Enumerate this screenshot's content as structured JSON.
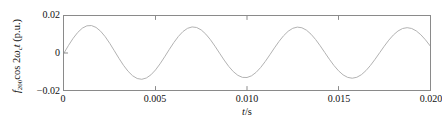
{
  "chart_data": {
    "type": "line",
    "title": "",
    "subtitle": "",
    "ylabel_prefix": "f",
    "ylabel_subscript": "200",
    "ylabel_mid": "cos 2",
    "ylabel_omega": "ω",
    "ylabel_omega_sub": "c",
    "ylabel_t": "t",
    "ylabel_units": " (p.u.)",
    "xlabel_var": "t",
    "xlabel_unit": "/s",
    "xlabel": "t/s",
    "ylabel": "f200cos 2ωct (p.u.)",
    "xlim": [
      0,
      0.02
    ],
    "ylim": [
      -0.02,
      0.02
    ],
    "xticks": [
      0,
      0.005,
      0.01,
      0.015,
      0.02
    ],
    "xticklabels": [
      "0",
      "0.005",
      "0.010",
      "0.015",
      "0.020"
    ],
    "yticks": [
      0.02,
      0,
      -0.02
    ],
    "yticklabels": [
      "0.02",
      "0",
      "−0.02"
    ],
    "grid": false,
    "legend": null,
    "series": [
      {
        "name": "f200cos2ωct",
        "color": "#b0b0b0",
        "amplitude": 0.018,
        "frequency_hz": 150,
        "period_s": 0.006667,
        "phase": "sine (starts at 0, rising)",
        "cycles": 3,
        "x": [
          0.0,
          0.00025,
          0.0005,
          0.00075,
          0.001,
          0.00125,
          0.0015,
          0.00175,
          0.002,
          0.00225,
          0.0025,
          0.00275,
          0.003,
          0.00325,
          0.0035,
          0.00375,
          0.004,
          0.00425,
          0.0045,
          0.00475,
          0.005,
          0.00525,
          0.0055,
          0.00575,
          0.006,
          0.00625,
          0.0065,
          0.00675,
          0.007,
          0.00725,
          0.0075,
          0.00775,
          0.008,
          0.00825,
          0.0085,
          0.00875,
          0.009,
          0.00925,
          0.0095,
          0.00975,
          0.01,
          0.01025,
          0.0105,
          0.01075,
          0.011,
          0.01125,
          0.0115,
          0.01175,
          0.012,
          0.01225,
          0.0125,
          0.01275,
          0.013,
          0.01325,
          0.0135,
          0.01375,
          0.014,
          0.01425,
          0.0145,
          0.01475,
          0.015,
          0.01525,
          0.0155,
          0.01575,
          0.016,
          0.01625,
          0.0165,
          0.01675,
          0.017,
          0.01725,
          0.0175,
          0.01775,
          0.018,
          0.01825,
          0.0185,
          0.01875,
          0.019,
          0.01925,
          0.0195,
          0.01975,
          0.02
        ],
        "y": [
          0.0,
          0.00414,
          0.00794,
          0.01112,
          0.01342,
          0.01469,
          0.01483,
          0.01384,
          0.01179,
          0.00884,
          0.00522,
          0.00122,
          -0.00283,
          -0.00663,
          -0.00987,
          -0.01232,
          -0.0138,
          -0.01421,
          -0.01352,
          -0.0118,
          -0.00917,
          -0.00584,
          -0.00207,
          0.00185,
          0.00562,
          0.00895,
          0.01159,
          0.01334,
          0.01409,
          0.01378,
          0.01245,
          0.0102,
          0.00721,
          0.00369,
          -8e-05,
          -0.00381,
          -0.00722,
          -0.01004,
          -0.01207,
          -0.01317,
          -0.01325,
          -0.01232,
          -0.01045,
          -0.00779,
          -0.00454,
          -0.00094,
          0.00275,
          0.00626,
          0.00934,
          0.01176,
          0.01335,
          0.01399,
          0.01364,
          0.01233,
          0.01016,
          0.00728,
          0.0039,
          0.00027,
          -0.00336,
          -0.00673,
          -0.00961,
          -0.01181,
          -0.01318,
          -0.01363,
          -0.01313,
          -0.01173,
          -0.00952,
          -0.00667,
          -0.00337,
          0.00016,
          0.00368,
          0.00695,
          0.00975,
          0.01189,
          0.01323,
          0.01369,
          0.01325,
          0.01194,
          0.00986,
          0.00714,
          0.00396
        ]
      }
    ]
  }
}
